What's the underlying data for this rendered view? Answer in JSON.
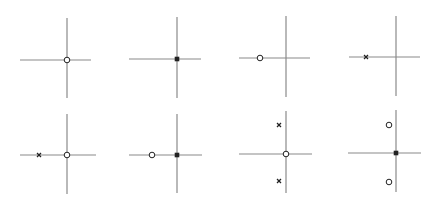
{
  "colors": {
    "axis": "#8a8a8a",
    "marker": "#222222",
    "background": "#ffffff"
  },
  "legend_semantics": {
    "circle": "zero",
    "cross": "pole",
    "filled-square": "coincident pole and zero at origin"
  },
  "panels": [
    {
      "id": 1,
      "origin": [
        67,
        60
      ],
      "h_range": [
        20,
        91
      ],
      "v_range": [
        18,
        98
      ],
      "markers": [
        {
          "type": "circle",
          "x": 67,
          "y": 60
        }
      ]
    },
    {
      "id": 2,
      "origin": [
        177,
        59
      ],
      "h_range": [
        129,
        201
      ],
      "v_range": [
        17,
        98
      ],
      "markers": [
        {
          "type": "square",
          "x": 177,
          "y": 59
        }
      ]
    },
    {
      "id": 3,
      "origin": [
        286,
        58
      ],
      "h_range": [
        239,
        310
      ],
      "v_range": [
        16,
        97
      ],
      "markers": [
        {
          "type": "circle",
          "x": 260,
          "y": 58
        }
      ]
    },
    {
      "id": 4,
      "origin": [
        396,
        57
      ],
      "h_range": [
        349,
        420
      ],
      "v_range": [
        16,
        96
      ],
      "markers": [
        {
          "type": "cross",
          "x": 366,
          "y": 57
        }
      ]
    },
    {
      "id": 5,
      "origin": [
        67,
        155
      ],
      "h_range": [
        20,
        96
      ],
      "v_range": [
        114,
        194
      ],
      "markers": [
        {
          "type": "cross",
          "x": 39,
          "y": 155
        },
        {
          "type": "circle",
          "x": 67,
          "y": 155
        }
      ]
    },
    {
      "id": 6,
      "origin": [
        177,
        155
      ],
      "h_range": [
        129,
        202
      ],
      "v_range": [
        114,
        193
      ],
      "markers": [
        {
          "type": "circle",
          "x": 152,
          "y": 155
        },
        {
          "type": "square",
          "x": 177,
          "y": 155
        }
      ]
    },
    {
      "id": 7,
      "origin": [
        286,
        154
      ],
      "h_range": [
        239,
        312
      ],
      "v_range": [
        111,
        193
      ],
      "markers": [
        {
          "type": "cross",
          "x": 279,
          "y": 125
        },
        {
          "type": "circle",
          "x": 286,
          "y": 154
        },
        {
          "type": "cross",
          "x": 279,
          "y": 181
        }
      ]
    },
    {
      "id": 8,
      "origin": [
        396,
        153
      ],
      "h_range": [
        348,
        421
      ],
      "v_range": [
        110,
        192
      ],
      "markers": [
        {
          "type": "circle",
          "x": 389,
          "y": 125
        },
        {
          "type": "square",
          "x": 396,
          "y": 153
        },
        {
          "type": "circle",
          "x": 389,
          "y": 182
        }
      ]
    }
  ]
}
